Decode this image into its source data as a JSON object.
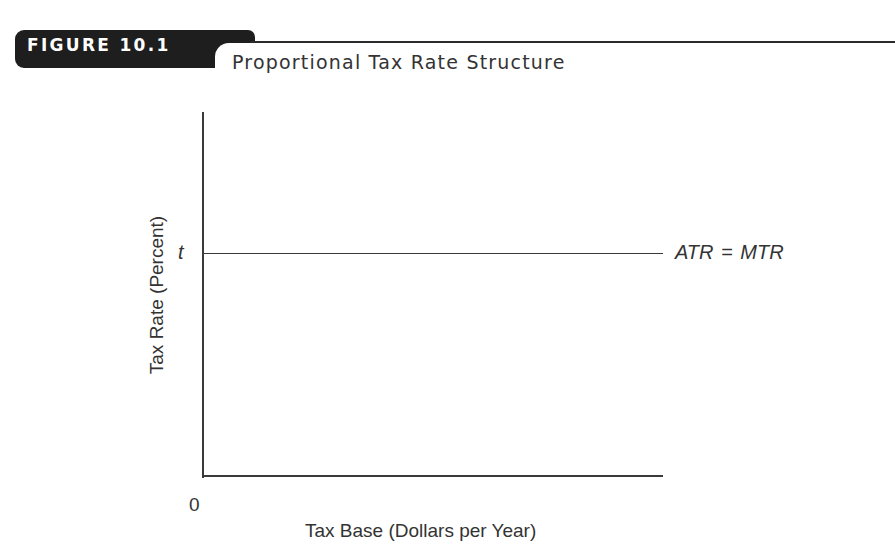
{
  "figure": {
    "number_label": "FIGURE 10.1",
    "title": "Proportional Tax Rate Structure"
  },
  "chart_data": {
    "type": "line",
    "title": "Proportional Tax Rate Structure",
    "xlabel": "Tax Base (Dollars per Year)",
    "ylabel": "Tax Rate (Percent)",
    "x_tick_labels": [
      "0"
    ],
    "y_tick_labels": [
      "t"
    ],
    "series": [
      {
        "name": "ATR = MTR",
        "x": [
          0,
          1
        ],
        "y": [
          "t",
          "t"
        ],
        "description": "Horizontal line at constant rate t: average tax rate equals marginal tax rate"
      }
    ],
    "grid": false,
    "legend": "inline label at right end of line",
    "colors": {
      "line": "#3a3a3a",
      "header_tab": "#1e1e1e"
    }
  },
  "labels": {
    "t": "t",
    "zero": "0",
    "series": "ATR = MTR",
    "x_axis": "Tax Base (Dollars per Year)",
    "y_axis": "Tax Rate (Percent)"
  }
}
